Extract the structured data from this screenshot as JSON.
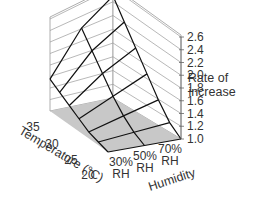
{
  "chart_data": {
    "type": "surface3d",
    "title": "",
    "zlabel": "Rate of increase",
    "xlabel": "Temperature (°C)",
    "ylabel": "Humidity",
    "z_ticks": [
      "1.0",
      "1.2",
      "1.4",
      "1.6",
      "1.8",
      "2.0",
      "2.2",
      "2.4",
      "2.6"
    ],
    "zlim": [
      1.0,
      2.6
    ],
    "temperature_ticks": [
      "20",
      "25",
      "30",
      "35"
    ],
    "humidity_ticks": [
      {
        "line1": "30%",
        "line2": "RH"
      },
      {
        "line1": "50%",
        "line2": "RH"
      },
      {
        "line1": "70%",
        "line2": "RH"
      }
    ],
    "x": [
      20,
      22.5,
      25,
      27.5,
      30,
      32.5,
      35
    ],
    "humidity": [
      "30% RH",
      "50% RH",
      "70% RH"
    ],
    "series": [
      {
        "name": "30% RH",
        "values": [
          1.0,
          1.05,
          1.1,
          1.2,
          1.3,
          1.4,
          1.5
        ]
      },
      {
        "name": "50% RH",
        "values": [
          1.0,
          1.1,
          1.25,
          1.45,
          1.7,
          1.95,
          2.2
        ]
      },
      {
        "name": "70% RH",
        "values": [
          1.0,
          1.15,
          1.4,
          1.7,
          2.0,
          2.3,
          2.6
        ]
      }
    ],
    "grid": true,
    "floor_color": "#c8c8c8",
    "line_color": "#111111"
  },
  "labels": {
    "zlabel_line1": "Rate of",
    "zlabel_line2": "increase",
    "xlabel": "Temperature (°C)",
    "ylabel": "Humidity"
  }
}
